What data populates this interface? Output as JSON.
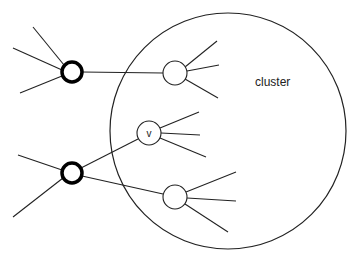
{
  "diagram": {
    "labels": {
      "cluster": "cluster",
      "v": "v"
    },
    "colors": {
      "stroke": "#222222",
      "background": "#ffffff"
    },
    "cluster_circle": {
      "cx": 228,
      "cy": 131,
      "r": 118
    },
    "external_nodes": [
      {
        "id": "ext-top",
        "cx": 72,
        "cy": 72,
        "r": 10,
        "bold": true,
        "stubs": [
          [
            33,
            27
          ],
          [
            13,
            48
          ],
          [
            20,
            93
          ]
        ]
      },
      {
        "id": "ext-bottom",
        "cx": 72,
        "cy": 173,
        "r": 10,
        "bold": true,
        "stubs": [
          [
            18,
            155
          ],
          [
            13,
            217
          ]
        ]
      }
    ],
    "cluster_nodes": [
      {
        "id": "top",
        "cx": 175,
        "cy": 73,
        "r": 12,
        "label": "",
        "stubs": [
          [
            217,
            41
          ],
          [
            219,
            65
          ],
          [
            218,
            98
          ]
        ]
      },
      {
        "id": "v",
        "cx": 149,
        "cy": 133,
        "r": 12,
        "label": "v",
        "stubs": [
          [
            199,
            112
          ],
          [
            200,
            135
          ],
          [
            206,
            157
          ]
        ]
      },
      {
        "id": "bottom",
        "cx": 175,
        "cy": 197,
        "r": 12,
        "label": "",
        "stubs": [
          [
            236,
            172
          ],
          [
            236,
            201
          ],
          [
            228,
            232
          ]
        ]
      }
    ],
    "edges": [
      {
        "from": "ext-top",
        "to": "top"
      },
      {
        "from": "ext-bottom",
        "to": "v"
      },
      {
        "from": "ext-bottom",
        "to": "bottom"
      }
    ]
  }
}
